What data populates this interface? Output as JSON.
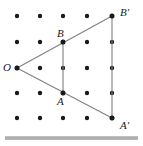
{
  "figure": {
    "background_color": "#ffffff",
    "line_color": "#808080",
    "dot_color": "#1a1a1a",
    "label_color": "#1a1a1a",
    "rule_color": "#a8a8a8",
    "grid": {
      "columns": 5,
      "rows": 5,
      "dot_radius": 2.2,
      "x_positions": [
        17,
        40,
        63,
        87,
        112
      ],
      "y_positions": [
        16,
        42,
        68,
        93,
        118
      ]
    },
    "points": [
      {
        "name": "O",
        "label": "O",
        "x": 17,
        "y": 68,
        "label_x": 3,
        "label_y": 62
      },
      {
        "name": "B",
        "label": "B",
        "x": 63,
        "y": 42,
        "label_x": 57,
        "label_y": 28
      },
      {
        "name": "A",
        "label": "A",
        "x": 63,
        "y": 93,
        "label_x": 57,
        "label_y": 96
      },
      {
        "name": "Bp",
        "label": "B'",
        "x": 112,
        "y": 16,
        "label_x": 120,
        "label_y": 7
      },
      {
        "name": "Ap",
        "label": "A'",
        "x": 112,
        "y": 118,
        "label_x": 120,
        "label_y": 120
      }
    ],
    "segments": [
      {
        "name": "segment-O-to-Bprime",
        "x1": 17,
        "y1": 68,
        "x2": 112,
        "y2": 16
      },
      {
        "name": "segment-O-to-Aprime",
        "x1": 17,
        "y1": 68,
        "x2": 112,
        "y2": 118
      },
      {
        "name": "segment-B-to-A",
        "x1": 63,
        "y1": 42,
        "x2": 63,
        "y2": 93
      },
      {
        "name": "segment-Bprime-to-Aprime",
        "x1": 112,
        "y1": 16,
        "x2": 112,
        "y2": 118
      }
    ],
    "bottom_rule": {
      "x": 5,
      "y": 136,
      "width": 133,
      "height": 4
    }
  }
}
